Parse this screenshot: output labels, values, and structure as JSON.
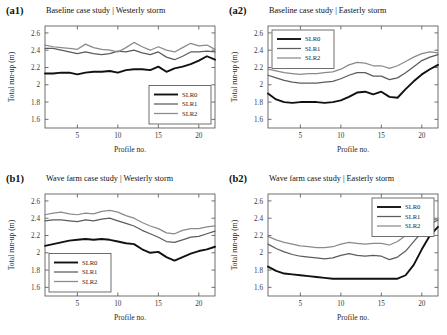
{
  "figure": {
    "axis_color": "#4d4d4d",
    "background": "#ffffff"
  },
  "series_styles": {
    "SLR0": {
      "color": "#111111",
      "width": 1.9
    },
    "SLR1": {
      "color": "#5c5c5c",
      "width": 1.25
    },
    "SLR2": {
      "color": "#8a8a8a",
      "width": 1.25
    }
  },
  "axis": {
    "xlabel": "Profile no.",
    "ylabel": "Total run-up (m)",
    "xticks": [
      5,
      10,
      15,
      20
    ],
    "yticks": [
      1.6,
      1.8,
      2.0,
      2.2,
      2.4,
      2.6
    ],
    "ytick_labels": [
      "1.6",
      "1.8",
      "2",
      "2.2",
      "2.4",
      "2.6"
    ],
    "xlim": [
      1,
      22
    ],
    "ylim": [
      1.5,
      2.68
    ],
    "grid": false
  },
  "legend": {
    "entries": [
      "SLR0",
      "SLR1",
      "SLR2"
    ],
    "position_a1": "bottom-right",
    "position_a2": "top-left",
    "position_b1": "bottom-left",
    "position_b2": "top-right"
  },
  "chart_data": [
    {
      "id": "a1",
      "type": "line",
      "tag": "(a1)",
      "title": "Baseline case study | Westerly storm",
      "xlabel": "Profile no.",
      "ylabel": "Total run-up (m)",
      "xlim": [
        1,
        22
      ],
      "ylim": [
        1.5,
        2.68
      ],
      "grid": false,
      "legend_position": "bottom-right",
      "x": [
        1,
        2,
        3,
        4,
        5,
        6,
        7,
        8,
        9,
        10,
        11,
        12,
        13,
        14,
        15,
        16,
        17,
        18,
        19,
        20,
        21,
        22
      ],
      "series": [
        {
          "name": "SLR0",
          "values": [
            2.13,
            2.13,
            2.14,
            2.14,
            2.12,
            2.14,
            2.15,
            2.15,
            2.16,
            2.14,
            2.17,
            2.18,
            2.18,
            2.17,
            2.21,
            2.15,
            2.19,
            2.21,
            2.24,
            2.28,
            2.33,
            2.29
          ]
        },
        {
          "name": "SLR1",
          "values": [
            2.42,
            2.42,
            2.4,
            2.38,
            2.36,
            2.38,
            2.36,
            2.35,
            2.36,
            2.39,
            2.38,
            2.4,
            2.37,
            2.35,
            2.38,
            2.32,
            2.29,
            2.33,
            2.38,
            2.38,
            2.39,
            2.38
          ]
        },
        {
          "name": "SLR2",
          "values": [
            2.46,
            2.44,
            2.43,
            2.42,
            2.41,
            2.47,
            2.43,
            2.41,
            2.4,
            2.38,
            2.43,
            2.49,
            2.44,
            2.4,
            2.44,
            2.4,
            2.38,
            2.43,
            2.48,
            2.45,
            2.46,
            2.41
          ]
        }
      ]
    },
    {
      "id": "a2",
      "type": "line",
      "tag": "(a2)",
      "title": "Baseline case study | Easterly storm",
      "xlabel": "Profile no.",
      "ylabel": "Total run-up (m)",
      "xlim": [
        1,
        22
      ],
      "ylim": [
        1.5,
        2.68
      ],
      "grid": false,
      "legend_position": "top-left",
      "x": [
        1,
        2,
        3,
        4,
        5,
        6,
        7,
        8,
        9,
        10,
        11,
        12,
        13,
        14,
        15,
        16,
        17,
        18,
        19,
        20,
        21,
        22
      ],
      "series": [
        {
          "name": "SLR0",
          "values": [
            1.9,
            1.83,
            1.8,
            1.79,
            1.8,
            1.8,
            1.8,
            1.79,
            1.8,
            1.82,
            1.86,
            1.91,
            1.92,
            1.89,
            1.92,
            1.86,
            1.85,
            1.95,
            2.04,
            2.12,
            2.18,
            2.23
          ]
        },
        {
          "name": "SLR1",
          "values": [
            2.11,
            2.08,
            2.05,
            2.03,
            2.02,
            2.02,
            2.02,
            2.03,
            2.04,
            2.07,
            2.11,
            2.14,
            2.14,
            2.1,
            2.1,
            2.06,
            2.08,
            2.14,
            2.21,
            2.28,
            2.32,
            2.35
          ]
        },
        {
          "name": "SLR2",
          "values": [
            2.18,
            2.16,
            2.14,
            2.13,
            2.12,
            2.13,
            2.13,
            2.14,
            2.15,
            2.18,
            2.23,
            2.26,
            2.25,
            2.22,
            2.22,
            2.19,
            2.22,
            2.27,
            2.32,
            2.36,
            2.38,
            2.37
          ]
        }
      ]
    },
    {
      "id": "b1",
      "type": "line",
      "tag": "(b1)",
      "title": "Wave farm case study | Westerly storm",
      "xlabel": "Profile no.",
      "ylabel": "Total run-up (m)",
      "xlim": [
        1,
        22
      ],
      "ylim": [
        1.5,
        2.68
      ],
      "grid": false,
      "legend_position": "bottom-left",
      "x": [
        1,
        2,
        3,
        4,
        5,
        6,
        7,
        8,
        9,
        10,
        11,
        12,
        13,
        14,
        15,
        16,
        17,
        18,
        19,
        20,
        21,
        22
      ],
      "series": [
        {
          "name": "SLR0",
          "values": [
            2.08,
            2.1,
            2.12,
            2.14,
            2.15,
            2.16,
            2.15,
            2.16,
            2.15,
            2.13,
            2.11,
            2.1,
            2.04,
            2.0,
            2.01,
            1.95,
            1.91,
            1.95,
            1.99,
            2.02,
            2.04,
            2.07
          ]
        },
        {
          "name": "SLR1",
          "values": [
            2.37,
            2.38,
            2.38,
            2.37,
            2.36,
            2.38,
            2.37,
            2.39,
            2.4,
            2.37,
            2.34,
            2.31,
            2.26,
            2.22,
            2.18,
            2.13,
            2.12,
            2.15,
            2.18,
            2.19,
            2.22,
            2.25
          ]
        },
        {
          "name": "SLR2",
          "values": [
            2.44,
            2.46,
            2.47,
            2.45,
            2.44,
            2.46,
            2.45,
            2.48,
            2.49,
            2.47,
            2.43,
            2.4,
            2.35,
            2.31,
            2.28,
            2.23,
            2.22,
            2.26,
            2.28,
            2.28,
            2.3,
            2.31
          ]
        }
      ]
    },
    {
      "id": "b2",
      "type": "line",
      "tag": "(b2)",
      "title": "Wave farm case study | Easterly storm",
      "xlabel": "Profile no.",
      "ylabel": "Total run-up (m)",
      "xlim": [
        1,
        22
      ],
      "ylim": [
        1.5,
        2.68
      ],
      "grid": false,
      "legend_position": "top-right",
      "x": [
        1,
        2,
        3,
        4,
        5,
        6,
        7,
        8,
        9,
        10,
        11,
        12,
        13,
        14,
        15,
        16,
        17,
        18,
        19,
        20,
        21,
        22
      ],
      "series": [
        {
          "name": "SLR0",
          "values": [
            1.84,
            1.79,
            1.76,
            1.75,
            1.74,
            1.73,
            1.72,
            1.71,
            1.7,
            1.7,
            1.7,
            1.7,
            1.7,
            1.7,
            1.7,
            1.7,
            1.7,
            1.74,
            1.86,
            2.04,
            2.2,
            2.3
          ]
        },
        {
          "name": "SLR1",
          "values": [
            2.1,
            2.05,
            2.01,
            1.98,
            1.96,
            1.95,
            1.94,
            1.93,
            1.94,
            1.97,
            1.99,
            1.97,
            1.96,
            1.97,
            1.96,
            1.92,
            1.95,
            2.02,
            2.13,
            2.24,
            2.33,
            2.38
          ]
        },
        {
          "name": "SLR2",
          "values": [
            2.19,
            2.15,
            2.12,
            2.1,
            2.08,
            2.07,
            2.06,
            2.06,
            2.07,
            2.1,
            2.12,
            2.11,
            2.1,
            2.11,
            2.11,
            2.09,
            2.13,
            2.2,
            2.28,
            2.34,
            2.38,
            2.39
          ]
        }
      ]
    }
  ]
}
